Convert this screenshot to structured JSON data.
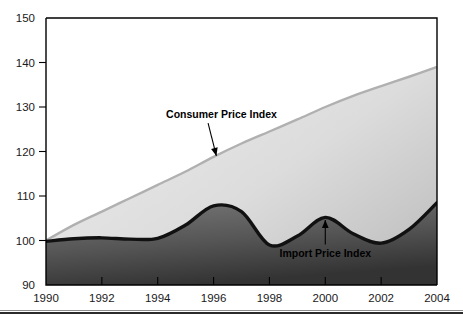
{
  "chart_data": {
    "type": "area",
    "title": "",
    "subtitle": "",
    "xlabel": "",
    "ylabel": "",
    "xlim": [
      1990,
      2004
    ],
    "ylim": [
      90,
      150
    ],
    "grid": false,
    "legend_position": "inline-annotations",
    "y_ticks": [
      90,
      100,
      110,
      120,
      130,
      140,
      150
    ],
    "x_ticks": [
      1990,
      1992,
      1994,
      1996,
      1998,
      2000,
      2002,
      2004
    ],
    "y_tick_labels": [
      "90",
      "100",
      "110",
      "120",
      "130",
      "140",
      "150"
    ],
    "x_tick_labels": [
      "1990",
      "1992",
      "1994",
      "1996",
      "1998",
      "2000",
      "2002",
      "2004"
    ],
    "x": [
      1990,
      1991,
      1992,
      1993,
      1994,
      1995,
      1996,
      1997,
      1998,
      1999,
      2000,
      2001,
      2002,
      2003,
      2004
    ],
    "series": [
      {
        "name": "Consumer Price Index",
        "style": "upper-area-boundary",
        "color": "#c9c9c9",
        "values": [
          100.0,
          103.5,
          106.5,
          109.5,
          112.5,
          115.5,
          118.8,
          121.8,
          124.5,
          127.2,
          130.0,
          132.5,
          134.7,
          136.8,
          139.0
        ]
      },
      {
        "name": "Import Price Index",
        "style": "thick-black-line",
        "color": "#111111",
        "values": [
          99.8,
          100.4,
          100.6,
          100.3,
          100.5,
          103.5,
          107.8,
          106.5,
          99.0,
          101.0,
          105.2,
          101.5,
          99.4,
          102.5,
          108.5
        ]
      }
    ],
    "annotations": [
      {
        "text": "Consumer Price Index",
        "target_x": 1996.1,
        "target_y": 119.0,
        "label_x": 1994.3,
        "label_y": 127.5,
        "arrow": "diagonal-down-left"
      },
      {
        "text": "Import Price Index",
        "target_x": 2000.0,
        "target_y": 104.6,
        "label_x": 2000.0,
        "label_y": 96.4,
        "arrow": "vertical-up"
      }
    ],
    "colors": {
      "lower_area_top": "#6e6e6e",
      "lower_area_bottom": "#3a3a3a",
      "upper_area_left": "#e6e6e6",
      "upper_area_right": "#c2c2c2",
      "import_line": "#111111",
      "cpi_line": "#b5b5b5",
      "axis": "#000000",
      "background": "#ffffff"
    }
  },
  "footer": {
    "rule": "double-horizontal-rule"
  }
}
